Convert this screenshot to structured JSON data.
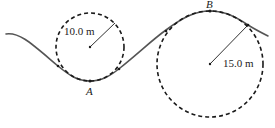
{
  "diagram": {
    "colors": {
      "track": "#555555",
      "circle": "#1a1a1a",
      "text": "#222222",
      "background": "#ffffff"
    },
    "circles": [
      {
        "id": "valley-circle",
        "radius_label": "10.0 m",
        "cx": 90,
        "cy": 47,
        "r": 34
      },
      {
        "id": "crest-circle",
        "radius_label": "15.0 m",
        "cx": 210,
        "cy": 64,
        "r": 53
      }
    ],
    "points": [
      {
        "id": "A",
        "label": "A",
        "x": 90,
        "y": 81
      },
      {
        "id": "B",
        "label": "B",
        "x": 210,
        "y": 11
      }
    ]
  }
}
